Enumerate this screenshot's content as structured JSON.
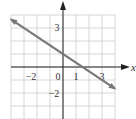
{
  "chart_data": {
    "type": "line",
    "title": "",
    "xlabel": "x",
    "ylabel": "",
    "xlim": [
      -4,
      4
    ],
    "ylim": [
      -4,
      4
    ],
    "grid": true,
    "x_ticks": [
      -2,
      0,
      1,
      3
    ],
    "y_ticks": [
      3,
      -2
    ],
    "x_tick_labels": [
      "−2",
      "0",
      "1",
      "3"
    ],
    "y_tick_labels": [
      "3",
      "−2"
    ],
    "series": [
      {
        "name": "line",
        "equation": "y = -2/3 x + 1",
        "x": [
          -4,
          4
        ],
        "y": [
          3.67,
          -1.67
        ],
        "arrows": "both"
      }
    ]
  },
  "colors": {
    "grid": "#cccccc",
    "axis": "#222222",
    "line": "#777777",
    "text": "#333333"
  }
}
